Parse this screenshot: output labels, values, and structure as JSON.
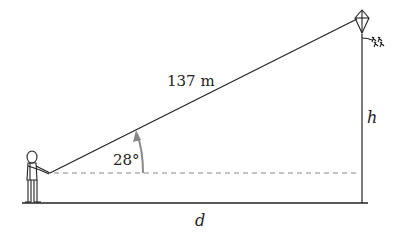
{
  "diagram": {
    "labels": {
      "string_length": "137 m",
      "angle": "28°",
      "height": "h",
      "distance": "d"
    },
    "elements": [
      "person",
      "kite",
      "kite-string",
      "ground-line",
      "dashed-horizontal",
      "vertical-height-line",
      "angle-arrow"
    ],
    "colors": {
      "line": "#222222",
      "dashed": "#888888",
      "arrow": "#888888"
    }
  }
}
